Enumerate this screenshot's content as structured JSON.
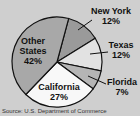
{
  "chart_data": {
    "type": "pie",
    "title": "",
    "slices": [
      {
        "label": "New York",
        "value": 12,
        "color": "#9a9a9a"
      },
      {
        "label": "Texas",
        "value": 12,
        "color": "#e2e2e2"
      },
      {
        "label": "Florida",
        "value": 7,
        "color": "#b5b5b5"
      },
      {
        "label": "California",
        "value": 27,
        "color": "#f8f8f8"
      },
      {
        "label": "Other States",
        "value": 42,
        "color": "#a8a8a8"
      }
    ],
    "labels": [
      "New York",
      "Texas",
      "Florida",
      "California",
      "Other States"
    ],
    "values": [
      12,
      12,
      7,
      27,
      42
    ],
    "unit": "%",
    "source_note": "Source: U.S. Department of Commerce"
  },
  "labels": {
    "new_york": {
      "name": "New York",
      "pct": "12%"
    },
    "texas": {
      "name": "Texas",
      "pct": "12%"
    },
    "florida": {
      "name": "Florida",
      "pct": "7%"
    },
    "california": {
      "name": "California",
      "pct": "27%"
    },
    "other": {
      "name1": "Other",
      "name2": "States",
      "pct": "42%"
    }
  },
  "source": "Source: U.S. Department of Commerce"
}
